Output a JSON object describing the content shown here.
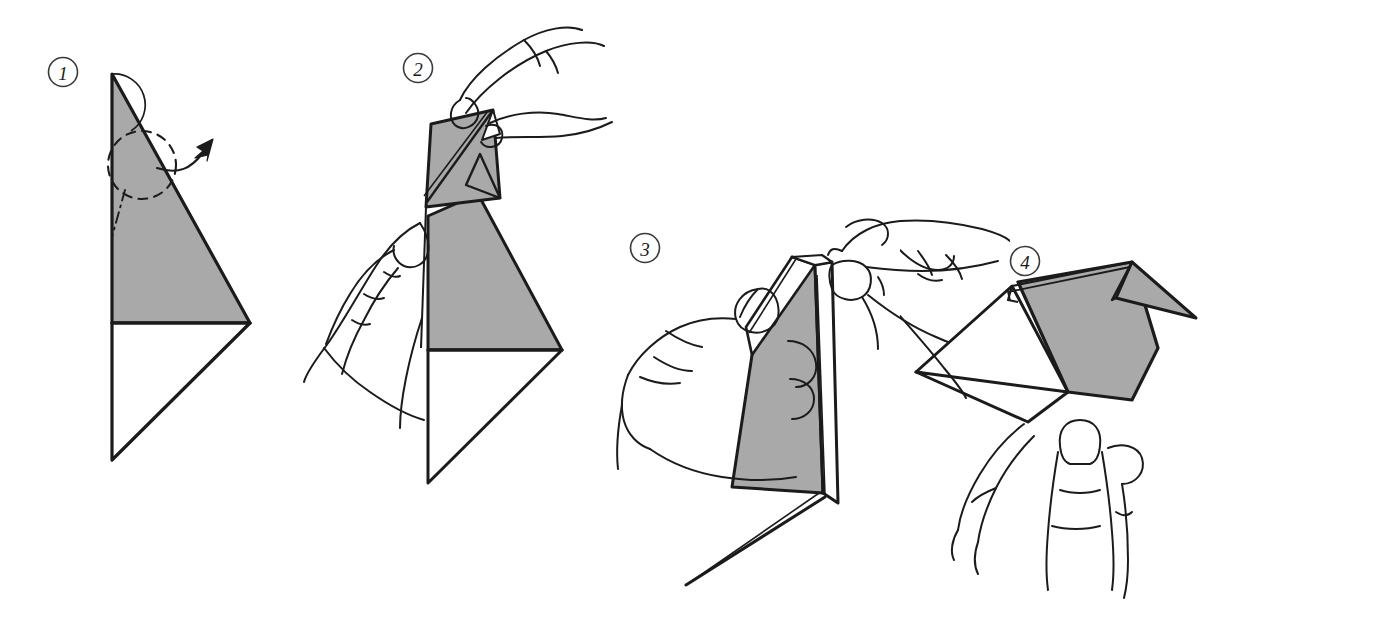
{
  "document": {
    "kind": "origami-instruction-diagram",
    "title": "Origami folding sequence",
    "background_color": "#ffffff",
    "step_count": 4
  },
  "palette": {
    "paper_shaded": "#a9a9a9",
    "paper_white": "#ffffff",
    "ink": "#1b1b1b",
    "ink_light": "#2a2a2a",
    "page": "#ffffff"
  },
  "steps": [
    {
      "number": "1",
      "badge_name": "step-number-1",
      "caption": "",
      "has_hands": false,
      "annotations": [
        "rotation-arc",
        "dashed-fold-circle",
        "curved-fold-arrow",
        "dash-dot-crease"
      ]
    },
    {
      "number": "2",
      "badge_name": "step-number-2",
      "caption": "",
      "has_hands": true,
      "annotations": [
        "upper-hand-right",
        "lower-hand-left",
        "folded-flap"
      ]
    },
    {
      "number": "3",
      "badge_name": "step-number-3",
      "caption": "",
      "has_hands": true,
      "annotations": [
        "left-hand-grip",
        "right-hand-thumb",
        "tail-edge"
      ]
    },
    {
      "number": "4",
      "badge_name": "step-number-4",
      "caption": "",
      "has_hands": true,
      "annotations": [
        "supporting-finger",
        "beak-triangle",
        "wing-panel"
      ]
    }
  ]
}
